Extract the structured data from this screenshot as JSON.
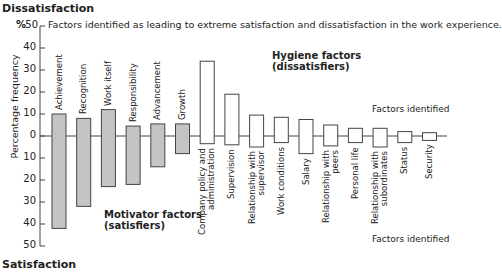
{
  "header": {
    "top_label": "Dissatisfaction",
    "bottom_label": "Satisfaction",
    "percent_marker": "%",
    "caption": "Factors identified as leading to extreme satisfaction and dissatisfaction in the work experience."
  },
  "labels": {
    "y_axis": "Percentage frequency",
    "hygiene_group": [
      "Hygiene factors",
      "(dissatisfiers)"
    ],
    "motivator_group": [
      "Motivator factors",
      "(satisfiers)"
    ],
    "factors_identified_top": "Factors identified",
    "factors_identified_bottom": "Factors identified"
  },
  "colors": {
    "motivator_fill": "#c4c4c4",
    "hygiene_fill": "#ffffff",
    "stroke": "#444444"
  },
  "chart_data": {
    "type": "bar",
    "title": "Factors identified as leading to extreme satisfaction and dissatisfaction in the work experience.",
    "xlabel": "",
    "ylabel": "Percentage frequency",
    "ylim": [
      -50,
      50
    ],
    "y_ticks_up": [
      "50",
      "40",
      "30",
      "20",
      "10",
      "0"
    ],
    "y_ticks_down": [
      "10",
      "20",
      "30",
      "40",
      "50"
    ],
    "y_axis_direction": "upward = Dissatisfaction, downward = Satisfaction",
    "grid": false,
    "categories": [
      "Achievement",
      "Recognition",
      "Work itself",
      "Responsibility",
      "Advancement",
      "Growth",
      "Company policy and administration",
      "Supervision",
      "Relationship with supervisor",
      "Work conditions",
      "Salary",
      "Relationship with peers",
      "Personal life",
      "Relationship with subordinates",
      "Status",
      "Security"
    ],
    "groups": [
      {
        "name": "Motivator factors (satisfiers)",
        "categories": [
          "Achievement",
          "Recognition",
          "Work itself",
          "Responsibility",
          "Advancement",
          "Growth"
        ]
      },
      {
        "name": "Hygiene factors (dissatisfiers)",
        "categories": [
          "Company policy and administration",
          "Supervision",
          "Relationship with supervisor",
          "Work conditions",
          "Salary",
          "Relationship with peers",
          "Personal life",
          "Relationship with subordinates",
          "Status",
          "Security"
        ]
      }
    ],
    "series": [
      {
        "name": "Dissatisfaction",
        "values": [
          10,
          8,
          12,
          4.5,
          5.5,
          5.5,
          34,
          19,
          9.5,
          8.5,
          7.5,
          5,
          3.5,
          3.5,
          2,
          1.5
        ]
      },
      {
        "name": "Satisfaction",
        "values": [
          42,
          32,
          23,
          22,
          14,
          8,
          3.5,
          4,
          5,
          3,
          8,
          4.5,
          3,
          5,
          3,
          2
        ]
      }
    ]
  },
  "bar_labels": [
    [
      "Achievement"
    ],
    [
      "Recognition"
    ],
    [
      "Work itself"
    ],
    [
      "Responsibility"
    ],
    [
      "Advancement"
    ],
    [
      "Growth"
    ],
    [
      "Company policy and",
      "administration"
    ],
    [
      "Supervision"
    ],
    [
      "Relationship with",
      "supervisor"
    ],
    [
      "Work conditions"
    ],
    [
      "Salary"
    ],
    [
      "Relationship with",
      "peers"
    ],
    [
      "Personal life"
    ],
    [
      "Relationship with",
      "subordinates"
    ],
    [
      "Status"
    ],
    [
      "Security"
    ]
  ]
}
